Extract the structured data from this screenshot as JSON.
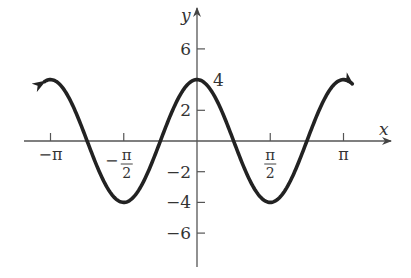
{
  "chart_data": {
    "type": "line",
    "title": "",
    "function": "y = 4cos(2x)",
    "xlabel": "x",
    "ylabel": "y",
    "xlim": [
      -3.3,
      3.9
    ],
    "ylim": [
      -8.5,
      8.7
    ],
    "grid": false,
    "legend": null,
    "x_ticks": [
      {
        "value": -3.14159,
        "label_main": "−π",
        "label_den": ""
      },
      {
        "value": -1.5708,
        "label_main": "−π",
        "label_den": "2"
      },
      {
        "value": 1.5708,
        "label_main": "π",
        "label_den": "2"
      },
      {
        "value": 3.14159,
        "label_main": "π",
        "label_den": ""
      }
    ],
    "y_ticks": [
      {
        "value": 6,
        "label": "6"
      },
      {
        "value": 2,
        "label": "2"
      },
      {
        "value": -2,
        "label": "−2"
      },
      {
        "value": -4,
        "label": "−4"
      },
      {
        "value": -6,
        "label": "−6"
      }
    ],
    "annotations": [
      {
        "x": 0,
        "y": 4,
        "text": "4"
      }
    ],
    "series": [
      {
        "name": "4cos(2x)",
        "color": "#222222",
        "x_range": [
          -3.27,
          3.33
        ],
        "end_arrows": true,
        "points": [
          [
            -3.14159,
            4
          ],
          [
            -2.35619,
            0
          ],
          [
            -1.5708,
            -4
          ],
          [
            -0.7854,
            0
          ],
          [
            0,
            4
          ],
          [
            0.7854,
            0
          ],
          [
            1.5708,
            -4
          ],
          [
            2.35619,
            0
          ],
          [
            3.14159,
            4
          ]
        ]
      }
    ]
  },
  "axes": {
    "x_axis_label": "x",
    "y_axis_label": "y",
    "peak_label": "4"
  },
  "colors": {
    "curve": "#222222",
    "axis": "#555555",
    "text": "#333333",
    "background": "#ffffff"
  }
}
